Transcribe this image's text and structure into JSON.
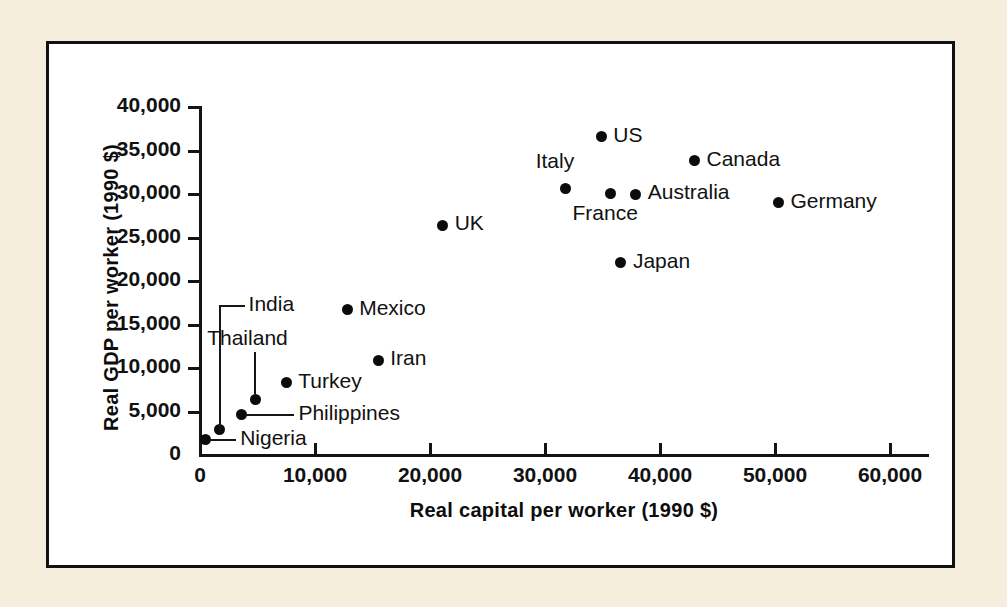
{
  "figure": {
    "background_color": "#f6eedc",
    "panel_color": "#ffffff",
    "frame_color": "#111111",
    "marker_color": "#0b0b0b"
  },
  "chart_data": {
    "type": "scatter",
    "title": "",
    "xlabel": "Real capital per worker (1990 $)",
    "ylabel": "Real GDP per worker (1990 $)",
    "xlim": [
      0,
      63500
    ],
    "ylim": [
      0,
      40000
    ],
    "grid": false,
    "legend": "none",
    "xticks": [
      {
        "value": 0,
        "label": "0"
      },
      {
        "value": 10000,
        "label": "10,000"
      },
      {
        "value": 20000,
        "label": "20,000"
      },
      {
        "value": 30000,
        "label": "30,000"
      },
      {
        "value": 40000,
        "label": "40,000"
      },
      {
        "value": 50000,
        "label": "50,000"
      },
      {
        "value": 60000,
        "label": "60,000"
      }
    ],
    "yticks": [
      {
        "value": 0,
        "label": "0"
      },
      {
        "value": 5000,
        "label": "5,000"
      },
      {
        "value": 10000,
        "label": "10,000"
      },
      {
        "value": 15000,
        "label": "15,000"
      },
      {
        "value": 20000,
        "label": "20,000"
      },
      {
        "value": 25000,
        "label": "25,000"
      },
      {
        "value": 30000,
        "label": "30,000"
      },
      {
        "value": 35000,
        "label": "35,000"
      },
      {
        "value": 40000,
        "label": "40,000"
      }
    ],
    "points": [
      {
        "name": "US",
        "x": 34900,
        "y": 36600,
        "label_side": "right"
      },
      {
        "name": "Canada",
        "x": 43000,
        "y": 33800,
        "label_side": "right"
      },
      {
        "name": "Italy",
        "x": 31800,
        "y": 30600,
        "label_side": "above-left"
      },
      {
        "name": "France",
        "x": 35700,
        "y": 30100,
        "label_side": "below"
      },
      {
        "name": "Australia",
        "x": 37900,
        "y": 30000,
        "label_side": "right"
      },
      {
        "name": "Germany",
        "x": 50300,
        "y": 29000,
        "label_side": "right"
      },
      {
        "name": "UK",
        "x": 21100,
        "y": 26400,
        "label_side": "right"
      },
      {
        "name": "Japan",
        "x": 36600,
        "y": 22100,
        "label_side": "right"
      },
      {
        "name": "Mexico",
        "x": 12800,
        "y": 16700,
        "label_side": "right"
      },
      {
        "name": "Iran",
        "x": 15500,
        "y": 10900,
        "label_side": "right"
      },
      {
        "name": "Turkey",
        "x": 7500,
        "y": 8300,
        "label_side": "right"
      },
      {
        "name": "Thailand",
        "x": 4800,
        "y": 6400,
        "label_side": "leader-up"
      },
      {
        "name": "Philippines",
        "x": 3600,
        "y": 4600,
        "label_side": "leader-right"
      },
      {
        "name": "India",
        "x": 1700,
        "y": 2900,
        "label_side": "leader-up-right"
      },
      {
        "name": "Nigeria",
        "x": 450,
        "y": 1750,
        "label_side": "leader-right"
      }
    ]
  }
}
